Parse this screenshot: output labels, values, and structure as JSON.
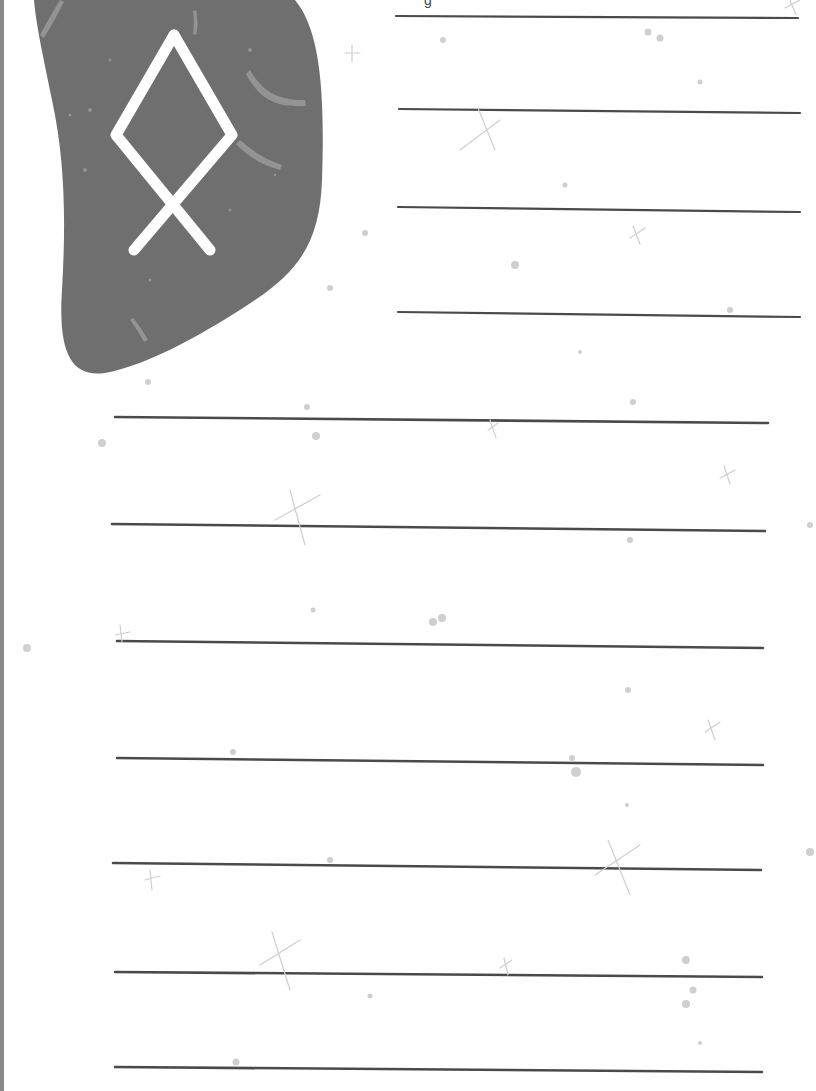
{
  "page": {
    "type": "journaling worksheet",
    "background_color": "#ffffff",
    "line_color": "#4a4a4a",
    "stone_color": "#6f6f6f",
    "rune_color": "#ffffff",
    "sparkle_color": "#c8c8c8"
  },
  "header": {
    "clipped_text_fragment": "g"
  },
  "rune_stone": {
    "rune_name": "othala-rune",
    "rune_glyph": "ᛟ"
  },
  "short_lines": {
    "count": 4,
    "y_positions": [
      17,
      111,
      210,
      315
    ]
  },
  "long_lines": {
    "count": 7,
    "y_positions": [
      420,
      528,
      645,
      762,
      867,
      975,
      1070
    ]
  }
}
